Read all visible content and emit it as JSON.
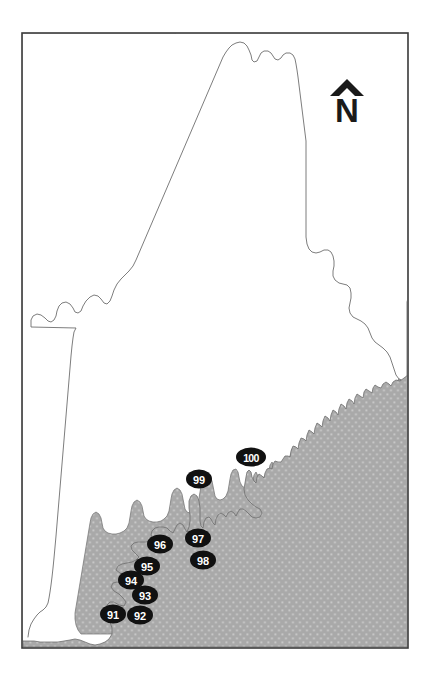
{
  "figure": {
    "width": 429,
    "height": 679,
    "background_color": "#ffffff",
    "frame": {
      "x": 22,
      "y": 33,
      "width": 386,
      "height": 615,
      "stroke_color": "#3a3a3a",
      "stroke_width": 1.6,
      "fill_color": "#ffffff"
    }
  },
  "colors": {
    "land_fill": "#ffffff",
    "land_stroke": "#6e6e6e",
    "ocean_fill": "#a9a9a9",
    "ocean_stipple": "#cfcfcf",
    "marker_fill": "#111111",
    "marker_text": "#ffffff",
    "north_arrow": "#1a1a1a",
    "frame_stroke": "#3a3a3a"
  },
  "north_arrow": {
    "name": "north-arrow",
    "letter": "N",
    "hat_shape": "triangle",
    "x": 347,
    "y": 106,
    "hat_y": 88
  },
  "ocean": {
    "name": "ocean-area",
    "label": "Atlantic Ocean",
    "fill": "#a9a9a9",
    "texture": "dotted-stipple",
    "stipple_dot_radius": 0.9,
    "stipple_spacing_x": 7,
    "stipple_spacing_y": 8
  },
  "land": {
    "name": "maine-state-outline",
    "label": "Maine",
    "fill": "#ffffff",
    "stroke": "#6e6e6e"
  },
  "markers": [
    {
      "id": "91",
      "label": "91",
      "cx": 113,
      "cy": 614,
      "rx": 13,
      "ry": 9.5,
      "wide": false
    },
    {
      "id": "92",
      "label": "92",
      "cx": 140,
      "cy": 615,
      "rx": 13,
      "ry": 9.5,
      "wide": false
    },
    {
      "id": "93",
      "label": "93",
      "cx": 145,
      "cy": 595,
      "rx": 13,
      "ry": 9.5,
      "wide": false
    },
    {
      "id": "94",
      "label": "94",
      "cx": 131,
      "cy": 580,
      "rx": 13,
      "ry": 9.5,
      "wide": false
    },
    {
      "id": "95",
      "label": "95",
      "cx": 147,
      "cy": 566,
      "rx": 13,
      "ry": 9.5,
      "wide": false
    },
    {
      "id": "96",
      "label": "96",
      "cx": 160,
      "cy": 544,
      "rx": 13,
      "ry": 9.5,
      "wide": false
    },
    {
      "id": "97",
      "label": "97",
      "cx": 198,
      "cy": 538,
      "rx": 13,
      "ry": 9.5,
      "wide": false
    },
    {
      "id": "98",
      "label": "98",
      "cx": 203,
      "cy": 560,
      "rx": 13,
      "ry": 9.5,
      "wide": false
    },
    {
      "id": "99",
      "label": "99",
      "cx": 199,
      "cy": 479,
      "rx": 13,
      "ry": 9.5,
      "wide": false
    },
    {
      "id": "100",
      "label": "100",
      "cx": 251,
      "cy": 457,
      "rx": 15,
      "ry": 9.5,
      "wide": true
    }
  ]
}
